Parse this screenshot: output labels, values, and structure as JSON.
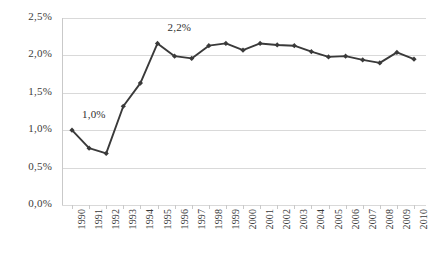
{
  "chart_data": {
    "type": "line",
    "title": "",
    "subtitle": "",
    "xlabel": "",
    "ylabel": "",
    "ylim": [
      0,
      2.5
    ],
    "ytick_step": 0.5,
    "ytick_labels": [
      "0,0%",
      "0,5%",
      "1,0%",
      "1,5%",
      "2,0%",
      "2,5%"
    ],
    "ytick_values": [
      0.0,
      0.5,
      1.0,
      1.5,
      2.0,
      2.5
    ],
    "grid": "horizontal",
    "legend": "none",
    "decimal_separator": ",",
    "categories": [
      "1990",
      "1991",
      "1992",
      "1993",
      "1994",
      "1995",
      "1996",
      "1997",
      "1998",
      "1999",
      "2000",
      "2001",
      "2002",
      "2003",
      "2004",
      "2005",
      "2006",
      "2007",
      "2008",
      "2009",
      "2010"
    ],
    "values": [
      1.0,
      0.76,
      0.69,
      1.32,
      1.63,
      2.16,
      1.99,
      1.96,
      2.13,
      2.16,
      2.07,
      2.16,
      2.14,
      2.13,
      2.05,
      1.98,
      1.99,
      1.94,
      1.9,
      2.04,
      1.95
    ],
    "series": [
      {
        "name": "",
        "color": "#3a3a3a",
        "marker": "diamond",
        "values": [
          1.0,
          0.76,
          0.69,
          1.32,
          1.63,
          2.16,
          1.99,
          1.96,
          2.13,
          2.16,
          2.07,
          2.16,
          2.14,
          2.13,
          2.05,
          1.98,
          1.99,
          1.94,
          1.9,
          2.04,
          1.95
        ]
      }
    ],
    "annotations": [
      {
        "text": "1,0%",
        "category": "1990",
        "value": 1.0
      },
      {
        "text": "2,2%",
        "category": "1995",
        "value": 2.16
      }
    ]
  },
  "style": {
    "line_color": "#3a3a3a",
    "marker_color": "#3a3a3a",
    "grid_color": "#d9d9d9",
    "axis_color": "#c9c9c9",
    "background": "#ffffff",
    "text_color": "#3b3b3b"
  }
}
